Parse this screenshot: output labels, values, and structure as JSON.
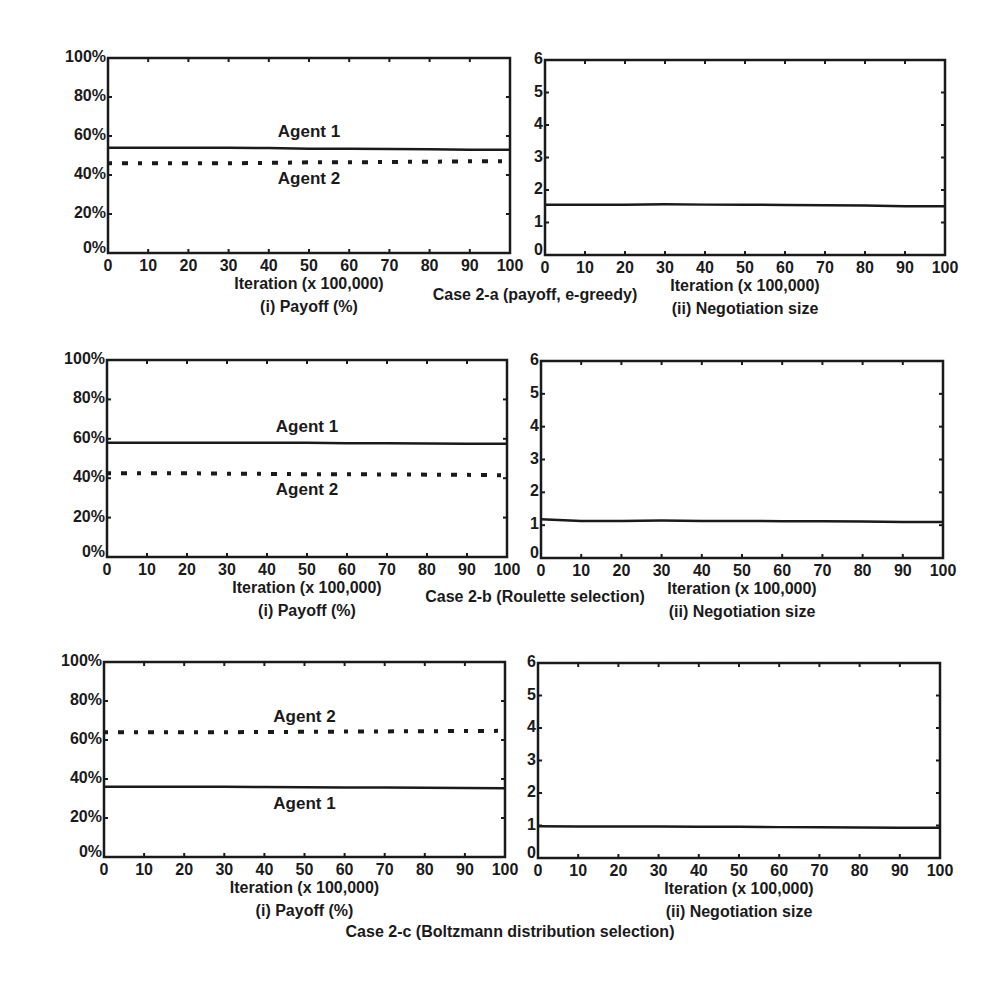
{
  "chart_data": [
    {
      "type": "line",
      "case": "Case 2-a (payoff, e-greedy)",
      "subtitle": "(i) Payoff (%)",
      "xlabel": "Iteration (x 100,000)",
      "ylabel": "",
      "xlim": [
        0,
        100
      ],
      "ylim": [
        0,
        100
      ],
      "xticks": [
        "0",
        "10",
        "20",
        "30",
        "40",
        "50",
        "60",
        "70",
        "80",
        "90",
        "100"
      ],
      "yticks": [
        "0%",
        "20%",
        "40%",
        "60%",
        "80%",
        "100%"
      ],
      "grid": false,
      "x": [
        0,
        10,
        20,
        30,
        40,
        50,
        60,
        70,
        80,
        90,
        100
      ],
      "series": [
        {
          "name": "Agent 1",
          "style": "solid",
          "values": [
            54,
            54,
            54,
            54,
            53.8,
            53.5,
            53.5,
            53.3,
            53.2,
            53,
            53
          ]
        },
        {
          "name": "Agent 2",
          "style": "dotted",
          "values": [
            46,
            46,
            46,
            46,
            46.2,
            46.5,
            46.5,
            46.7,
            46.8,
            47,
            47
          ]
        }
      ],
      "annotations": [
        {
          "text": "Agent 1",
          "x": 50,
          "y": 62
        },
        {
          "text": "Agent 2",
          "x": 50,
          "y": 38
        }
      ]
    },
    {
      "type": "line",
      "case": "Case 2-a (payoff, e-greedy)",
      "subtitle": "(ii) Negotiation size",
      "xlabel": "Iteration (x 100,000)",
      "ylabel": "",
      "xlim": [
        0,
        100
      ],
      "ylim": [
        0,
        6
      ],
      "xticks": [
        "0",
        "10",
        "20",
        "30",
        "40",
        "50",
        "60",
        "70",
        "80",
        "90",
        "100"
      ],
      "yticks": [
        "0",
        "1",
        "2",
        "3",
        "4",
        "5",
        "6"
      ],
      "grid": false,
      "x": [
        0,
        10,
        20,
        30,
        40,
        50,
        60,
        70,
        80,
        90,
        100
      ],
      "series": [
        {
          "name": "Negotiation size",
          "style": "solid",
          "values": [
            1.55,
            1.55,
            1.55,
            1.56,
            1.55,
            1.55,
            1.54,
            1.53,
            1.52,
            1.5,
            1.5
          ]
        }
      ]
    },
    {
      "type": "line",
      "case": "Case 2-b (Roulette selection)",
      "subtitle": "(i) Payoff (%)",
      "xlabel": "Iteration (x 100,000)",
      "ylabel": "",
      "xlim": [
        0,
        100
      ],
      "ylim": [
        0,
        100
      ],
      "xticks": [
        "0",
        "10",
        "20",
        "30",
        "40",
        "50",
        "60",
        "70",
        "80",
        "90",
        "100"
      ],
      "yticks": [
        "0%",
        "20%",
        "40%",
        "60%",
        "80%",
        "100%"
      ],
      "grid": false,
      "x": [
        0,
        10,
        20,
        30,
        40,
        50,
        60,
        70,
        80,
        90,
        100
      ],
      "series": [
        {
          "name": "Agent 1",
          "style": "solid",
          "values": [
            58,
            58,
            58,
            58,
            58,
            58,
            57.8,
            57.7,
            57.6,
            57.5,
            57.5
          ]
        },
        {
          "name": "Agent 2",
          "style": "dotted",
          "values": [
            42.5,
            42.5,
            42.5,
            42.3,
            42.2,
            42,
            42,
            41.9,
            41.8,
            41.7,
            41.5
          ]
        }
      ],
      "annotations": [
        {
          "text": "Agent 1",
          "x": 50,
          "y": 66
        },
        {
          "text": "Agent 2",
          "x": 50,
          "y": 34
        }
      ]
    },
    {
      "type": "line",
      "case": "Case 2-b (Roulette selection)",
      "subtitle": "(ii) Negotiation size",
      "xlabel": "Iteration (x 100,000)",
      "ylabel": "",
      "xlim": [
        0,
        100
      ],
      "ylim": [
        0,
        6
      ],
      "xticks": [
        "0",
        "10",
        "20",
        "30",
        "40",
        "50",
        "60",
        "70",
        "80",
        "90",
        "100"
      ],
      "yticks": [
        "0",
        "1",
        "2",
        "3",
        "4",
        "5",
        "6"
      ],
      "grid": false,
      "x": [
        0,
        10,
        20,
        30,
        40,
        50,
        60,
        70,
        80,
        90,
        100
      ],
      "series": [
        {
          "name": "Negotiation size",
          "style": "solid",
          "values": [
            1.18,
            1.13,
            1.13,
            1.14,
            1.13,
            1.13,
            1.12,
            1.12,
            1.11,
            1.1,
            1.1
          ]
        }
      ]
    },
    {
      "type": "line",
      "case": "Case 2-c (Boltzmann distribution selection)",
      "subtitle": "(i) Payoff (%)",
      "xlabel": "Iteration (x 100,000)",
      "ylabel": "",
      "xlim": [
        0,
        100
      ],
      "ylim": [
        0,
        100
      ],
      "xticks": [
        "0",
        "10",
        "20",
        "30",
        "40",
        "50",
        "60",
        "70",
        "80",
        "90",
        "100"
      ],
      "yticks": [
        "0%",
        "20%",
        "40%",
        "60%",
        "80%",
        "100%"
      ],
      "grid": false,
      "x": [
        0,
        10,
        20,
        30,
        40,
        50,
        60,
        70,
        80,
        90,
        100
      ],
      "series": [
        {
          "name": "Agent 1",
          "style": "solid",
          "values": [
            36,
            36,
            36,
            36,
            35.9,
            35.8,
            35.7,
            35.6,
            35.5,
            35.4,
            35.3
          ]
        },
        {
          "name": "Agent 2",
          "style": "dotted",
          "values": [
            64,
            64,
            64,
            64,
            64.1,
            64.2,
            64.3,
            64.4,
            64.5,
            64.6,
            64.7
          ]
        }
      ],
      "annotations": [
        {
          "text": "Agent 2",
          "x": 50,
          "y": 72
        },
        {
          "text": "Agent 1",
          "x": 50,
          "y": 27
        }
      ]
    },
    {
      "type": "line",
      "case": "Case 2-c (Boltzmann distribution selection)",
      "subtitle": "(ii) Negotiation size",
      "xlabel": "Iteration (x 100,000)",
      "ylabel": "",
      "xlim": [
        0,
        100
      ],
      "ylim": [
        0,
        6
      ],
      "xticks": [
        "0",
        "10",
        "20",
        "30",
        "40",
        "50",
        "60",
        "70",
        "80",
        "90",
        "100"
      ],
      "yticks": [
        "0",
        "1",
        "2",
        "3",
        "4",
        "5",
        "6"
      ],
      "grid": false,
      "x": [
        0,
        10,
        20,
        30,
        40,
        50,
        60,
        70,
        80,
        90,
        100
      ],
      "series": [
        {
          "name": "Negotiation size",
          "style": "solid",
          "values": [
            0.98,
            0.97,
            0.97,
            0.97,
            0.96,
            0.96,
            0.95,
            0.95,
            0.94,
            0.93,
            0.93
          ]
        }
      ]
    }
  ],
  "figure": {
    "cases": [
      "Case 2-a (payoff, e-greedy)",
      "Case 2-b (Roulette selection)",
      "Case 2-c (Boltzmann distribution selection)"
    ],
    "colors": {
      "line": "#1a1a1a",
      "background": "#ffffff"
    }
  }
}
